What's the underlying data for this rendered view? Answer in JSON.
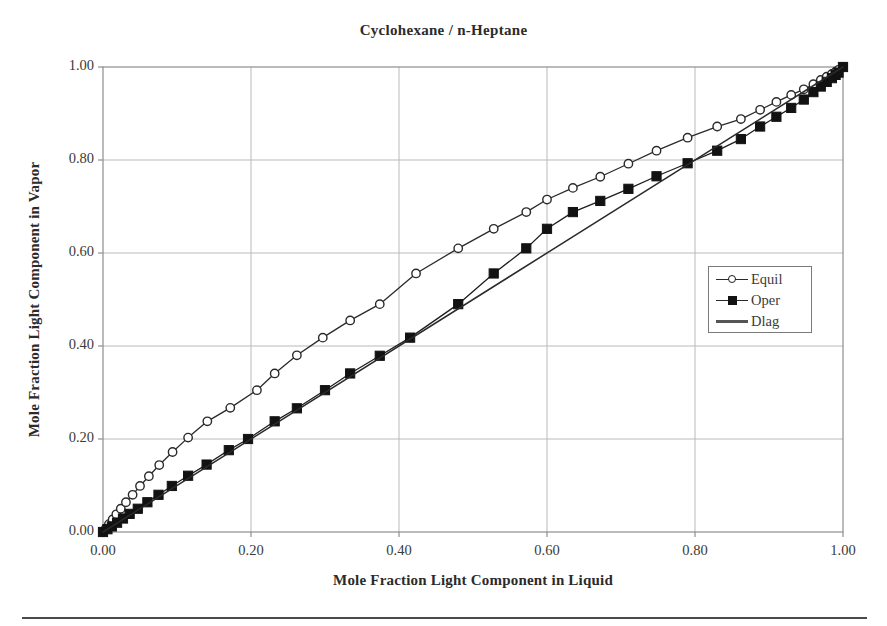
{
  "chart_data": {
    "type": "line",
    "title": "Cyclohexane / n-Heptane",
    "xlabel": "Mole Fraction Light Component in Liquid",
    "ylabel": "Mole Fraction Light Component in Vapor",
    "xlim": [
      0.0,
      1.0
    ],
    "ylim": [
      0.0,
      1.0
    ],
    "grid": true,
    "xticks": [
      "0.00",
      "0.20",
      "0.40",
      "0.60",
      "0.80",
      "1.00"
    ],
    "yticks": [
      "0.00",
      "0.20",
      "0.40",
      "0.60",
      "0.80",
      "1.00"
    ],
    "xtick_values": [
      0.0,
      0.2,
      0.4,
      0.6,
      0.8,
      1.0
    ],
    "ytick_values": [
      0.0,
      0.2,
      0.4,
      0.6,
      0.8,
      1.0
    ],
    "legend_position": "center-right",
    "series": [
      {
        "name": "Equil",
        "marker": "open-circle",
        "line_color": "#2a2a2a",
        "points": [
          [
            0.0,
            0.0
          ],
          [
            0.004,
            0.008
          ],
          [
            0.008,
            0.017
          ],
          [
            0.013,
            0.027
          ],
          [
            0.018,
            0.038
          ],
          [
            0.024,
            0.05
          ],
          [
            0.031,
            0.064
          ],
          [
            0.04,
            0.08
          ],
          [
            0.05,
            0.099
          ],
          [
            0.062,
            0.12
          ],
          [
            0.076,
            0.144
          ],
          [
            0.094,
            0.172
          ],
          [
            0.115,
            0.203
          ],
          [
            0.141,
            0.238
          ],
          [
            0.172,
            0.267
          ],
          [
            0.208,
            0.305
          ],
          [
            0.232,
            0.341
          ],
          [
            0.262,
            0.38
          ],
          [
            0.297,
            0.418
          ],
          [
            0.334,
            0.455
          ],
          [
            0.374,
            0.49
          ],
          [
            0.423,
            0.556
          ],
          [
            0.48,
            0.61
          ],
          [
            0.528,
            0.652
          ],
          [
            0.572,
            0.688
          ],
          [
            0.6,
            0.715
          ],
          [
            0.635,
            0.74
          ],
          [
            0.672,
            0.764
          ],
          [
            0.71,
            0.792
          ],
          [
            0.748,
            0.82
          ],
          [
            0.79,
            0.848
          ],
          [
            0.83,
            0.872
          ],
          [
            0.862,
            0.888
          ],
          [
            0.888,
            0.908
          ],
          [
            0.91,
            0.925
          ],
          [
            0.93,
            0.94
          ],
          [
            0.947,
            0.952
          ],
          [
            0.96,
            0.963
          ],
          [
            0.97,
            0.972
          ],
          [
            0.978,
            0.979
          ],
          [
            0.985,
            0.985
          ],
          [
            0.99,
            0.99
          ],
          [
            0.994,
            0.994
          ],
          [
            1.0,
            1.0
          ]
        ]
      },
      {
        "name": "Oper",
        "marker": "filled-square",
        "line_color": "#1d1d1d",
        "points": [
          [
            0.0,
            0.0
          ],
          [
            0.006,
            0.006
          ],
          [
            0.012,
            0.012
          ],
          [
            0.019,
            0.02
          ],
          [
            0.027,
            0.029
          ],
          [
            0.036,
            0.039
          ],
          [
            0.047,
            0.05
          ],
          [
            0.06,
            0.064
          ],
          [
            0.075,
            0.08
          ],
          [
            0.093,
            0.099
          ],
          [
            0.115,
            0.121
          ],
          [
            0.14,
            0.145
          ],
          [
            0.17,
            0.176
          ],
          [
            0.196,
            0.2
          ],
          [
            0.232,
            0.238
          ],
          [
            0.262,
            0.266
          ],
          [
            0.3,
            0.305
          ],
          [
            0.334,
            0.341
          ],
          [
            0.374,
            0.379
          ],
          [
            0.415,
            0.418
          ],
          [
            0.48,
            0.49
          ],
          [
            0.528,
            0.556
          ],
          [
            0.572,
            0.61
          ],
          [
            0.6,
            0.652
          ],
          [
            0.635,
            0.688
          ],
          [
            0.672,
            0.712
          ],
          [
            0.71,
            0.738
          ],
          [
            0.748,
            0.765
          ],
          [
            0.79,
            0.793
          ],
          [
            0.83,
            0.82
          ],
          [
            0.862,
            0.845
          ],
          [
            0.888,
            0.872
          ],
          [
            0.91,
            0.893
          ],
          [
            0.93,
            0.912
          ],
          [
            0.947,
            0.93
          ],
          [
            0.96,
            0.946
          ],
          [
            0.97,
            0.958
          ],
          [
            0.978,
            0.968
          ],
          [
            0.985,
            0.976
          ],
          [
            0.99,
            0.983
          ],
          [
            0.994,
            0.988
          ],
          [
            1.0,
            1.0
          ]
        ]
      },
      {
        "name": "Dlag",
        "marker": "none",
        "line_color": "#2a2a2a",
        "points": [
          [
            0.0,
            0.0
          ],
          [
            1.0,
            1.0
          ]
        ]
      }
    ]
  },
  "legend": {
    "items": [
      {
        "label": "Equil"
      },
      {
        "label": "Oper"
      },
      {
        "label": "Dlag"
      }
    ]
  }
}
